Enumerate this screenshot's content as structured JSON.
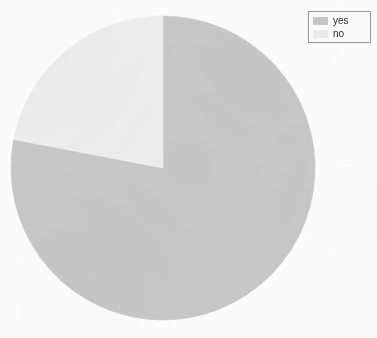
{
  "chart": {
    "title": "",
    "background_color": "#fdfdfd",
    "center_x": 163,
    "center_y": 168,
    "radius": 152
  },
  "legend": {
    "position": "top-right",
    "border_color": "#9a9a9a",
    "background_color": "#fdfdfd",
    "entries": [
      {
        "label": "yes",
        "color": "#c8c8c8"
      },
      {
        "label": "no",
        "color": "#eeeeee"
      }
    ]
  },
  "chart_data": {
    "type": "pie",
    "title": "",
    "categories": [
      "yes",
      "no"
    ],
    "values": [
      78,
      22
    ],
    "unit": "percent",
    "colors": [
      "#c8c8c8",
      "#eeeeee"
    ],
    "start_angle_deg": 0,
    "direction": "clockwise",
    "legend_position": "top-right",
    "grid": false,
    "xlabel": "",
    "ylabel": "",
    "slices": [
      {
        "label": "yes",
        "value": 78,
        "color": "#c8c8c8",
        "start_angle_deg": 0,
        "end_angle_deg": 280.8
      },
      {
        "label": "no",
        "value": 22,
        "color": "#eeeeee",
        "start_angle_deg": 280.8,
        "end_angle_deg": 360
      }
    ]
  }
}
